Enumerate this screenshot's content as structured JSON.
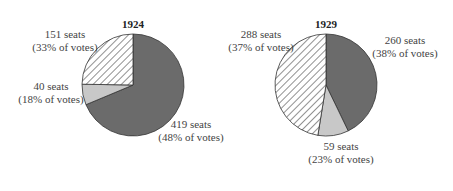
{
  "chart_data": [
    {
      "type": "pie",
      "title": "1924",
      "slices": [
        {
          "label": "419 seats",
          "sub": "(48% of votes)",
          "seats": 419,
          "vote_pct": 48,
          "fill": "solid-dark"
        },
        {
          "label": "40 seats",
          "sub": "(18% of votes)",
          "seats": 40,
          "vote_pct": 18,
          "fill": "light-gray"
        },
        {
          "label": "151 seats",
          "sub": "(33% of votes)",
          "seats": 151,
          "vote_pct": 33,
          "fill": "hatched"
        }
      ]
    },
    {
      "type": "pie",
      "title": "1929",
      "slices": [
        {
          "label": "260 seats",
          "sub": "(38% of votes)",
          "seats": 260,
          "vote_pct": 38,
          "fill": "solid-dark"
        },
        {
          "label": "59 seats",
          "sub": "(23% of votes)",
          "seats": 59,
          "vote_pct": 23,
          "fill": "light-gray"
        },
        {
          "label": "288 seats",
          "sub": "(37% of votes)",
          "seats": 288,
          "vote_pct": 37,
          "fill": "hatched"
        }
      ]
    }
  ],
  "colors": {
    "dark": "#6b6b6b",
    "light": "#c8c8c8",
    "hatch_line": "#555555",
    "outline": "#333333"
  }
}
